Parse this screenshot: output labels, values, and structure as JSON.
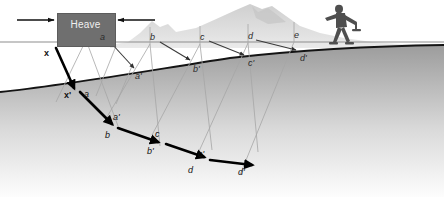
{
  "diagram": {
    "heave_label": "Heave",
    "colors": {
      "heave_box": "#6f6f6f",
      "ground_dark": "#9a9a9a",
      "ground_light": "#fbfbfb",
      "mountain": "#d8d8d8",
      "guide_line": "#9e9e9e",
      "surface_line": "#1a1a1a",
      "arrow_thin": "#3a3a3a",
      "arrow_thick": "#000000",
      "figure": "#4a4a4a"
    },
    "surface_labels": [
      {
        "id": "a",
        "text": "a",
        "x": 100,
        "y": 33
      },
      {
        "id": "b",
        "text": "b",
        "x": 150,
        "y": 33
      },
      {
        "id": "c",
        "text": "c",
        "x": 200,
        "y": 33
      },
      {
        "id": "d",
        "text": "d",
        "x": 248,
        "y": 32
      },
      {
        "id": "e",
        "text": "e",
        "x": 294,
        "y": 31
      }
    ],
    "slope_labels": [
      {
        "id": "a-prime",
        "text": "a'",
        "x": 135,
        "y": 72
      },
      {
        "id": "b-prime",
        "text": "b'",
        "x": 193,
        "y": 65
      },
      {
        "id": "c-prime",
        "text": "c'",
        "x": 248,
        "y": 59
      },
      {
        "id": "d-prime",
        "text": "d'",
        "x": 300,
        "y": 54
      }
    ],
    "path_labels": [
      {
        "id": "x-top",
        "text": "x",
        "x": 44,
        "y": 49,
        "bold": true
      },
      {
        "id": "x-prime",
        "text": "x'",
        "x": 64,
        "y": 91,
        "bold": true
      },
      {
        "id": "a-path",
        "text": "a",
        "x": 84,
        "y": 90
      },
      {
        "id": "a-prime-p",
        "text": "a'",
        "x": 113,
        "y": 113
      },
      {
        "id": "b-path",
        "text": "b",
        "x": 105,
        "y": 131
      },
      {
        "id": "b-prime-p",
        "text": "b'",
        "x": 147,
        "y": 147
      },
      {
        "id": "c-path",
        "text": "c",
        "x": 155,
        "y": 130
      },
      {
        "id": "c-prime-p",
        "text": "c'",
        "x": 198,
        "y": 150
      },
      {
        "id": "d-path",
        "text": "d",
        "x": 188,
        "y": 166
      },
      {
        "id": "d-prime-p",
        "text": "d'",
        "x": 238,
        "y": 168
      }
    ]
  }
}
